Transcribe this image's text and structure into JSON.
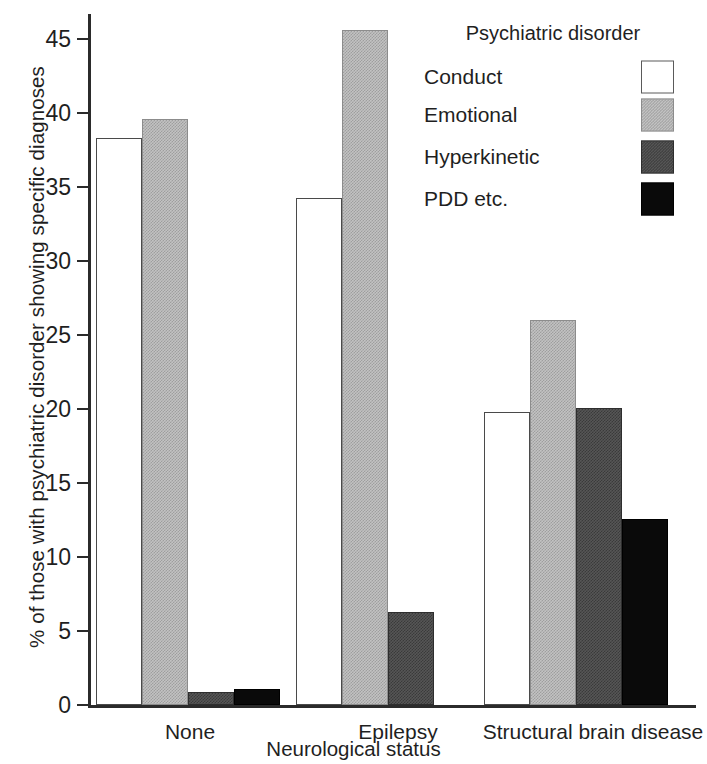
{
  "chart_data": {
    "type": "bar",
    "title": "",
    "xlabel": "Neurological status",
    "ylabel": "% of those with psychiatric disorder showing specific diagnoses",
    "categories": [
      "None",
      "Epilepsy",
      "Structural brain disease"
    ],
    "series": [
      {
        "name": "Conduct",
        "values": [
          38.3,
          34.3,
          19.8
        ]
      },
      {
        "name": "Emotional",
        "values": [
          39.6,
          45.6,
          26.0
        ]
      },
      {
        "name": "Hyperkinetic",
        "values": [
          0.9,
          6.3,
          20.1
        ]
      },
      {
        "name": "PDD etc.",
        "values": [
          1.1,
          0,
          12.6
        ]
      }
    ],
    "ylim": [
      0,
      46.5
    ],
    "yticks": [
      0,
      5,
      10,
      15,
      20,
      25,
      30,
      35,
      40,
      45
    ],
    "ytick_labels": [
      "0",
      "5",
      "10",
      "15",
      "20",
      "25",
      "30",
      "35",
      "40",
      "45"
    ],
    "grid": false,
    "legend_position": "top-right",
    "legend_title": "Psychiatric disorder",
    "colors": {
      "Conduct": "#ffffff",
      "Emotional": "#c2c2c2",
      "Hyperkinetic": "#565656",
      "PDD etc.": "#0a0a0a"
    }
  }
}
